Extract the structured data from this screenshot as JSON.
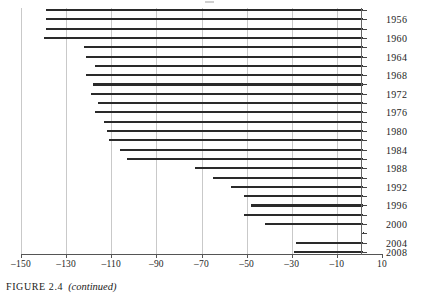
{
  "figure": {
    "caption_label": "FIGURE 2.4",
    "caption_note": "(continued)"
  },
  "chart_data": {
    "type": "bar",
    "orientation": "horizontal",
    "title": "",
    "xlabel": "",
    "ylabel": "",
    "xlim": [
      -150,
      10
    ],
    "ylim_categories_top_to_bottom": true,
    "grid": "vertical gridlines at each labeled x tick",
    "legend": "none",
    "bar_color": "#2a2a2a",
    "baseline_value": 1.5,
    "xticks": [
      -150,
      -130,
      -110,
      -90,
      -70,
      -50,
      -30,
      -10,
      10
    ],
    "xtick_labels": [
      "-150",
      "-130",
      "-110",
      "-90",
      "-70",
      "-50",
      "-30",
      "-10",
      "10"
    ],
    "categories": [
      "1955",
      "1957",
      "1959",
      "1961",
      "1963",
      "1965",
      "1967",
      "1969",
      "1971",
      "1973",
      "1975",
      "1977",
      "1979",
      "1981",
      "1983",
      "1985",
      "1987",
      "1989",
      "1991",
      "1993",
      "1995",
      "1997",
      "1999",
      "2001",
      "2003",
      "2005",
      "2007"
    ],
    "ytick_labels_shown": [
      "1956",
      "1960",
      "1964",
      "1968",
      "1972",
      "1976",
      "1980",
      "1984",
      "1988",
      "1992",
      "1996",
      "2000",
      "2004",
      "2008"
    ],
    "values": [
      -139,
      -139,
      -139,
      -140,
      -122,
      -121,
      -117,
      -121,
      -118,
      -119,
      -116,
      -117,
      -113,
      -112,
      -111,
      -106,
      -103,
      -73,
      -65,
      -57,
      -51,
      -48,
      -51,
      -42,
      1.5,
      -28,
      -29
    ],
    "bars": [
      {
        "category": "1955",
        "start": -139,
        "end": 1.5
      },
      {
        "category": "1957",
        "start": -139,
        "end": 1.5
      },
      {
        "category": "1959",
        "start": -139,
        "end": 1.5
      },
      {
        "category": "1961",
        "start": -140,
        "end": 1.5
      },
      {
        "category": "1963",
        "start": -122,
        "end": 1.5
      },
      {
        "category": "1965",
        "start": -121,
        "end": 1.5
      },
      {
        "category": "1967",
        "start": -117,
        "end": 1.5
      },
      {
        "category": "1969",
        "start": -121,
        "end": 1.5
      },
      {
        "category": "1971",
        "start": -118,
        "end": 1.5
      },
      {
        "category": "1973",
        "start": -119,
        "end": 1.5
      },
      {
        "category": "1975",
        "start": -116,
        "end": 1.5
      },
      {
        "category": "1977",
        "start": -117,
        "end": 1.5
      },
      {
        "category": "1979",
        "start": -113,
        "end": 1.5
      },
      {
        "category": "1981",
        "start": -112,
        "end": 1.5
      },
      {
        "category": "1983",
        "start": -111,
        "end": 1.5
      },
      {
        "category": "1985",
        "start": -106,
        "end": 1.5
      },
      {
        "category": "1987",
        "start": -103,
        "end": 1.5
      },
      {
        "category": "1989",
        "start": -73,
        "end": 1.5
      },
      {
        "category": "1991",
        "start": -65,
        "end": 1.5
      },
      {
        "category": "1993",
        "start": -57,
        "end": 1.5
      },
      {
        "category": "1995",
        "start": -51,
        "end": 1.5
      },
      {
        "category": "1997",
        "start": -48,
        "end": 1.5
      },
      {
        "category": "1999",
        "start": -51,
        "end": 1.5
      },
      {
        "category": "2001",
        "start": -42,
        "end": 1.5
      },
      {
        "category": "2003",
        "start": 1.5,
        "end": 1.5
      },
      {
        "category": "2005",
        "start": -28,
        "end": 1.5
      },
      {
        "category": "2007",
        "start": -29,
        "end": 1.5
      }
    ]
  }
}
